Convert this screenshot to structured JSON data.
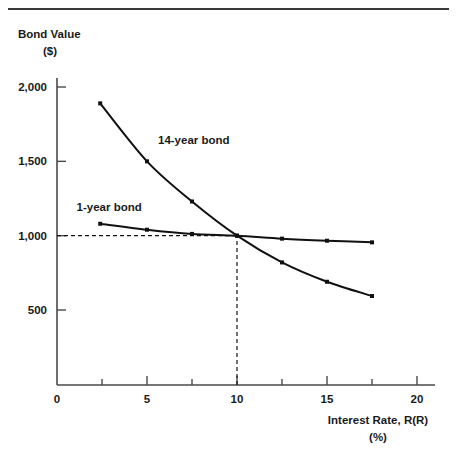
{
  "chart_data": {
    "type": "line",
    "title": "",
    "ylabel": "Bond Value",
    "ylabel_unit": "($)",
    "xlabel": "Interest Rate, R(R)",
    "xlabel_unit": "(%)",
    "xlim": [
      0,
      20
    ],
    "ylim": [
      0,
      2150
    ],
    "grid": false,
    "legend_position": "inline-annotations",
    "x_ticks": [
      "0",
      "5",
      "10",
      "15",
      "20"
    ],
    "x_tick_values": [
      0,
      5,
      10,
      15,
      20
    ],
    "x_minor_tick_values": [
      2.5,
      7.5,
      12.5,
      17.5
    ],
    "y_ticks": [
      "500",
      "1,000",
      "1,500",
      "2,000"
    ],
    "y_tick_values": [
      500,
      1000,
      1500,
      2000
    ],
    "annotations": [
      {
        "text": "14-year bond",
        "x": 7.6,
        "y": 1620
      },
      {
        "text": "1-year bond",
        "x": 2.9,
        "y": 1165
      }
    ],
    "reference_lines": [
      {
        "name": "par-value-horizontal",
        "from": [
          0,
          1000
        ],
        "to": [
          10,
          1000
        ],
        "style": "dashed"
      },
      {
        "name": "equilibrium-vertical",
        "from": [
          10,
          0
        ],
        "to": [
          10,
          1000
        ],
        "style": "dashed"
      }
    ],
    "series": [
      {
        "name": "14-year bond",
        "color": "#111111",
        "x": [
          2.4,
          5,
          7.5,
          10,
          12.5,
          15,
          17.5
        ],
        "values": [
          1890,
          1500,
          1230,
          1000,
          820,
          690,
          594
        ]
      },
      {
        "name": "1-year bond",
        "color": "#111111",
        "x": [
          2.4,
          5,
          7.5,
          10,
          12.5,
          15,
          17.5
        ],
        "values": [
          1080,
          1040,
          1012,
          1000,
          980,
          966,
          955
        ]
      }
    ]
  }
}
